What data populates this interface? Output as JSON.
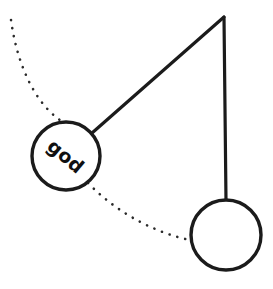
{
  "figure": {
    "background_color": "#ffffff",
    "stroke_color": "#1b1b1b",
    "dotted_color": "#2b2b2b",
    "width": 273,
    "height": 289
  },
  "pivot": {
    "name": "pivot-point",
    "x": 224,
    "y": 17
  },
  "rods": [
    {
      "name": "rod-vertical",
      "x1": 224,
      "y1": 17,
      "x2": 226,
      "y2": 201
    },
    {
      "name": "rod-diagonal",
      "x1": 224,
      "y1": 17,
      "x2": 92,
      "y2": 133
    }
  ],
  "bobs": [
    {
      "name": "bob-displaced",
      "label": "god",
      "label_rotation": 40,
      "cx": 66,
      "cy": 156,
      "r": 34
    },
    {
      "name": "bob-rest",
      "label": "",
      "label_rotation": 0,
      "cx": 226,
      "cy": 235,
      "r": 35
    }
  ],
  "trajectory": {
    "name": "swing-arc",
    "style": "dotted",
    "path": "M 11 20 C 18 70, 38 108, 66 124 M 88 183 C 120 216, 160 234, 190 240"
  }
}
